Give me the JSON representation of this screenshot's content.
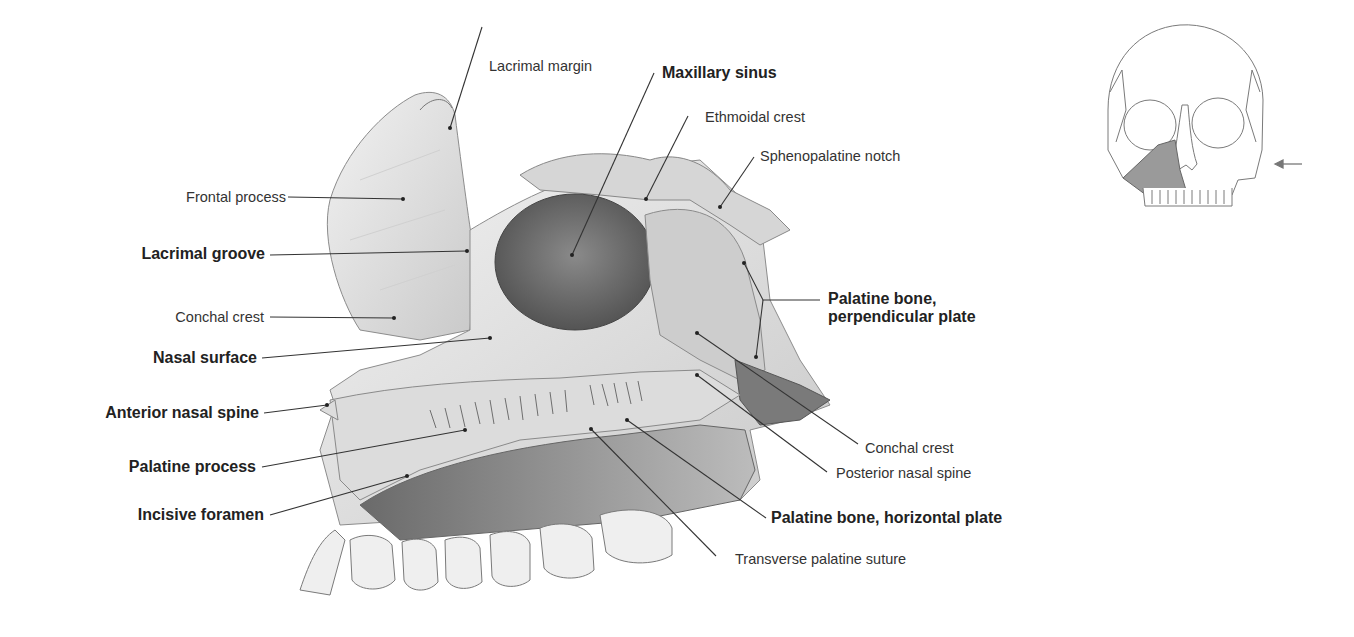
{
  "figure": {
    "labels": {
      "lacrimal_margin": "Lacrimal margin",
      "maxillary_sinus": "Maxillary sinus",
      "ethmoidal_crest": "Ethmoidal crest",
      "sphenopalatine_notch": "Sphenopalatine notch",
      "frontal_process": "Frontal process",
      "lacrimal_groove": "Lacrimal groove",
      "conchal_crest_left": "Conchal crest",
      "nasal_surface": "Nasal surface",
      "anterior_nasal_spine": "Anterior nasal spine",
      "palatine_process": "Palatine process",
      "incisive_foramen": "Incisive foramen",
      "palatine_perpendicular_line1": "Palatine bone,",
      "palatine_perpendicular_line2": "perpendicular plate",
      "conchal_crest_right": "Conchal crest",
      "posterior_nasal_spine": "Posterior nasal spine",
      "palatine_horizontal": "Palatine bone, horizontal plate",
      "transverse_palatine_suture": "Transverse palatine suture"
    },
    "colors": {
      "bone_light": "#e9e9e9",
      "bone_mid": "#bdbdbd",
      "bone_dark": "#6f6f6f",
      "leader_line": "#333333",
      "highlight": "#9a9a9a"
    }
  },
  "orientation_inset": {
    "description": "Skull, anterior view, left maxilla shaded",
    "arrow_direction": "left"
  }
}
